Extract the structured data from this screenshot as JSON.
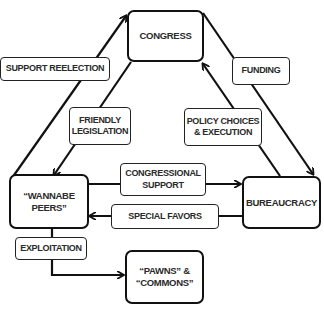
{
  "diagram": {
    "type": "flow",
    "nodes": {
      "congress": "CONGRESS",
      "peers": "“WANNABE\nPEERS”",
      "bureaucracy": "BUREAUCRACY",
      "pawns": "“PAWNS” &\n“COMMONS”"
    },
    "edges": {
      "support_reelection": "SUPPORT REELECTION",
      "friendly_legislation": "FRIENDLY\nLEGISLATION",
      "funding": "FUNDING",
      "policy_choices": "POLICY CHOICES\n& EXECUTION",
      "congressional_support": "CONGRESSIONAL\nSUPPORT",
      "special_favors": "SPECIAL FAVORS",
      "exploitation": "EXPLOITATION"
    },
    "connections": [
      {
        "from": "peers",
        "to": "congress",
        "label": "SUPPORT REELECTION"
      },
      {
        "from": "congress",
        "to": "peers",
        "label": "FRIENDLY LEGISLATION"
      },
      {
        "from": "congress",
        "to": "bureaucracy",
        "label": "FUNDING"
      },
      {
        "from": "bureaucracy",
        "to": "congress",
        "label": "POLICY CHOICES & EXECUTION"
      },
      {
        "from": "peers",
        "to": "bureaucracy",
        "label": "CONGRESSIONAL SUPPORT"
      },
      {
        "from": "bureaucracy",
        "to": "peers",
        "label": "SPECIAL FAVORS"
      },
      {
        "from": "peers",
        "to": "pawns",
        "label": "EXPLOITATION"
      }
    ],
    "colors": {
      "line": "#111111",
      "text": "#2a2a2a",
      "background": "#ffffff"
    }
  }
}
